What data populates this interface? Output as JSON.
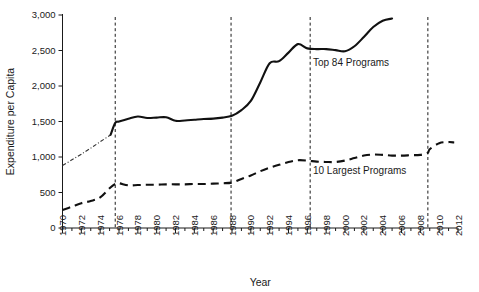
{
  "chart_data": {
    "type": "line",
    "title": "",
    "xlabel": "Year",
    "ylabel": "Expenditure per Capita",
    "xlim": [
      1970,
      2012
    ],
    "ylim": [
      0,
      3000
    ],
    "grid": false,
    "legend_position": "inline-annotations",
    "y_ticks": [
      0,
      500,
      1000,
      1500,
      2000,
      2500,
      3000
    ],
    "y_tick_labels": [
      "0",
      "500",
      "1,000",
      "1,500",
      "2,000",
      "2,500",
      "3,000"
    ],
    "x_ticks": [
      1970,
      1972,
      1974,
      1976,
      1978,
      1980,
      1982,
      1984,
      1986,
      1988,
      1990,
      1992,
      1994,
      1996,
      1998,
      2000,
      2002,
      2004,
      2006,
      2008,
      2010,
      2012
    ],
    "x_tick_labels": [
      "1970",
      "1972",
      "1974",
      "1976",
      "1978",
      "1980",
      "1982",
      "1984",
      "1986",
      "1988",
      "1990",
      "1992",
      "1994",
      "1996",
      "1998",
      "2000",
      "2002",
      "2004",
      "2006",
      "2008",
      "2010",
      "2012"
    ],
    "x_minor_tick_step": 1,
    "annotations": [
      {
        "text": "Top 84 Programs",
        "x": 1996.6,
        "y": 2280
      },
      {
        "text": "10 Largest Programs",
        "x": 1996.6,
        "y": 760
      }
    ],
    "vertical_reference_lines": [
      {
        "x": 1975.6,
        "style": "dashed"
      },
      {
        "x": 1987.9,
        "style": "dashed"
      },
      {
        "x": 1996.3,
        "style": "dashed"
      },
      {
        "x": 2008.8,
        "style": "dashed"
      }
    ],
    "series": [
      {
        "name": "Top 84 Programs",
        "style": "solid",
        "x": [
          1975.1,
          1975.6,
          1976,
          1977,
          1978,
          1979,
          1980,
          1981,
          1982,
          1983,
          1984,
          1985,
          1986,
          1987,
          1988,
          1989,
          1990,
          1991,
          1992,
          1993,
          1994,
          1995,
          1996,
          1997,
          1998,
          1999,
          2000,
          2001,
          2002,
          2003,
          2004,
          2005
        ],
        "values": [
          1310,
          1480,
          1500,
          1540,
          1570,
          1550,
          1555,
          1560,
          1510,
          1515,
          1525,
          1535,
          1540,
          1555,
          1580,
          1660,
          1790,
          2050,
          2320,
          2350,
          2470,
          2590,
          2530,
          2520,
          2520,
          2505,
          2490,
          2560,
          2690,
          2830,
          2920,
          2950
        ]
      },
      {
        "name": "Top 84 Programs (extrapolated)",
        "style": "dashdot",
        "x": [
          1970,
          1971,
          1972,
          1973,
          1974,
          1975.1
        ],
        "values": [
          880,
          960,
          1040,
          1125,
          1215,
          1310
        ]
      },
      {
        "name": "10 Largest Programs",
        "style": "dashed",
        "x": [
          1970,
          1971,
          1972,
          1973,
          1974,
          1975,
          1975.6,
          1976,
          1977,
          1978,
          1979,
          1980,
          1981,
          1982,
          1983,
          1984,
          1985,
          1986,
          1987,
          1988,
          1989,
          1990,
          1991,
          1992,
          1993,
          1994,
          1995,
          1996,
          1997,
          1998,
          1999,
          2000,
          2001,
          2002,
          2003,
          2004,
          2005,
          2006,
          2007,
          2008,
          2008.8,
          2009,
          2010,
          2011,
          2011.6
        ],
        "values": [
          255,
          300,
          350,
          380,
          430,
          560,
          620,
          630,
          600,
          605,
          610,
          610,
          615,
          615,
          615,
          620,
          620,
          625,
          630,
          640,
          690,
          740,
          800,
          850,
          890,
          930,
          955,
          950,
          935,
          930,
          930,
          950,
          985,
          1020,
          1035,
          1030,
          1020,
          1020,
          1025,
          1030,
          1060,
          1110,
          1195,
          1210,
          1205
        ]
      }
    ]
  }
}
